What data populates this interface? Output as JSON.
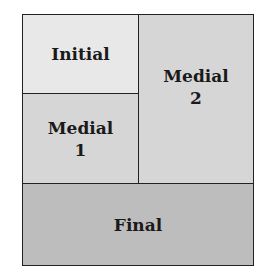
{
  "diagram": {
    "regions": {
      "initial": {
        "line1": "Initial",
        "fill": "#e8e8e8"
      },
      "medial1": {
        "line1": "Medial",
        "line2": "1",
        "fill": "#d6d6d6"
      },
      "medial2": {
        "line1": "Medial",
        "line2": "2",
        "fill": "#d6d6d6"
      },
      "final": {
        "line1": "Final",
        "fill": "#bdbdbd"
      }
    }
  }
}
